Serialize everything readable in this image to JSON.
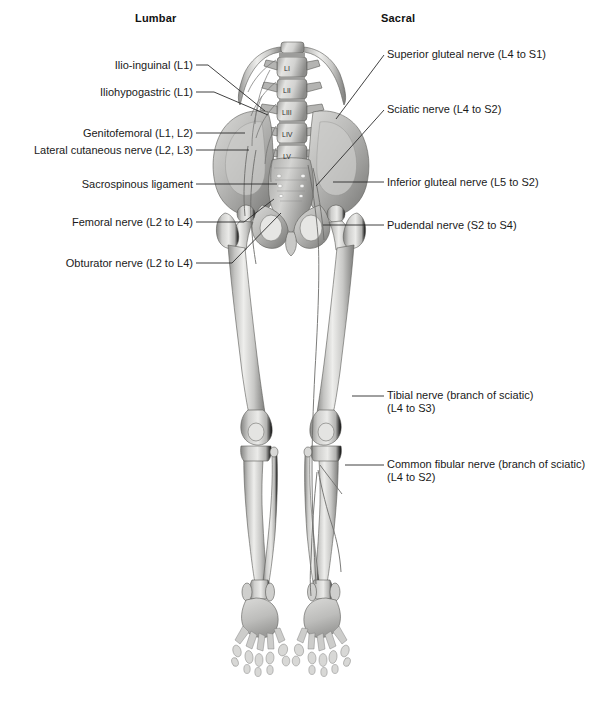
{
  "figure": {
    "title_left": "Lumbar",
    "title_right": "Sacral",
    "colors": {
      "background": "#ffffff",
      "bone_light": "#e8e8e6",
      "bone_mid": "#b9b9b7",
      "bone_shadow": "#8a8a88",
      "bone_dark": "#6a6a68",
      "outline": "#4a4a48",
      "leader_line": "#2b2b2b",
      "text": "#1a1a1a"
    }
  },
  "headers": [
    {
      "label": "Lumbar",
      "x": 135,
      "y": 12
    },
    {
      "label": "Sacral",
      "x": 381,
      "y": 12
    }
  ],
  "vertebrae": [
    {
      "label": "LI",
      "cx": 291,
      "cy": 68
    },
    {
      "label": "LII",
      "cx": 291,
      "cy": 90
    },
    {
      "label": "LIII",
      "cx": 291,
      "cy": 112
    },
    {
      "label": "LIV",
      "cx": 291,
      "cy": 134
    },
    {
      "label": "LV",
      "cx": 291,
      "cy": 156
    }
  ],
  "labels_left": [
    {
      "name": "ilio-inguinal",
      "lines": [
        "Ilio-inguinal (L1)"
      ],
      "text_right": 193,
      "text_top": 59,
      "leader": "M196,65 L208,65 L265,111"
    },
    {
      "name": "iliohypogastric",
      "lines": [
        "Iliohypogastric (L1)"
      ],
      "text_right": 193,
      "text_top": 86,
      "leader": "M196,92 L214,92 L268,115"
    },
    {
      "name": "genitofemoral",
      "lines": [
        "Genitofemoral (L1, L2)"
      ],
      "text_right": 193,
      "text_top": 127,
      "leader": "M196,133 L245,133"
    },
    {
      "name": "lateral-cutaneous-nerve",
      "lines": [
        "Lateral cutaneous nerve (L2, L3)"
      ],
      "text_right": 193,
      "text_top": 144,
      "leader": "M196,150 L249,150"
    },
    {
      "name": "sacrospinous-ligament",
      "lines": [
        "Sacrospinous ligament"
      ],
      "text_right": 193,
      "text_top": 178,
      "leader": "M196,184 L277,184"
    },
    {
      "name": "femoral-nerve",
      "lines": [
        "Femoral nerve (L2 to L4)"
      ],
      "text_right": 193,
      "text_top": 216,
      "leader": "M196,222 L244,222 L274,199"
    },
    {
      "name": "obturator-nerve",
      "lines": [
        "Obturator nerve (L2 to L4)"
      ],
      "text_right": 193,
      "text_top": 257,
      "leader": "M196,263 L232,263 L281,213"
    }
  ],
  "labels_right": [
    {
      "name": "superior-gluteal-nerve",
      "lines": [
        "Superior gluteal nerve (L4 to S1)"
      ],
      "text_left": 387,
      "text_top": 48,
      "leader": "M384,55 L336,119"
    },
    {
      "name": "sciatic-nerve",
      "lines": [
        "Sciatic nerve (L4 to S2)"
      ],
      "text_left": 387,
      "text_top": 103,
      "leader": "M384,110 L316,186"
    },
    {
      "name": "inferior-gluteal-nerve",
      "lines": [
        "Inferior gluteal nerve (L5 to S2)"
      ],
      "text_left": 387,
      "text_top": 176,
      "leader": "M384,182 L333,182"
    },
    {
      "name": "pudendal-nerve",
      "lines": [
        "Pudendal nerve (S2 to S4)"
      ],
      "text_left": 387,
      "text_top": 219,
      "leader": "M384,225 L323,225"
    },
    {
      "name": "tibial-nerve",
      "lines": [
        "Tibial nerve (branch of sciatic)",
        "(L4 to S3)"
      ],
      "text_left": 387,
      "text_top": 389,
      "leader": "M384,396 L352,396"
    },
    {
      "name": "common-fibular-nerve",
      "lines": [
        "Common fibular nerve (branch of sciatic)",
        "(L4 to S2)"
      ],
      "text_left": 387,
      "text_top": 458,
      "leader": "M384,465 L345,465"
    }
  ]
}
